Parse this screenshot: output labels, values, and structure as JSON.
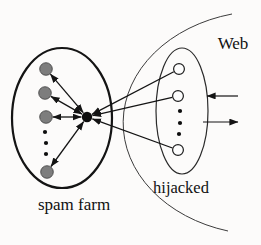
{
  "diagram": {
    "background": "#fcfbfa",
    "line_color": "#141414",
    "labels": {
      "web": "Web",
      "spam_farm": "spam farm",
      "hijacked": "hijacked"
    },
    "label_positions": {
      "web": {
        "x": 233,
        "y": 49,
        "size": 17
      },
      "spam_farm": {
        "x": 74,
        "y": 210,
        "size": 17
      },
      "hijacked": {
        "x": 181,
        "y": 193,
        "size": 16.5
      }
    },
    "regions": {
      "web_boundary": {
        "path": "M 232 14 A 142 112 0 0 0 228 231",
        "stroke": "#3c3c3c",
        "stroke_width": 1
      },
      "spam_farm_ellipse": {
        "cx": 62,
        "cy": 118,
        "rx": 50,
        "ry": 70,
        "stroke": "#141414",
        "stroke_width": 2.2
      },
      "hijacked_ellipse": {
        "cx": 182,
        "cy": 111,
        "rx": 26,
        "ry": 63,
        "stroke": "#2a2a2a",
        "stroke_width": 1.2
      }
    },
    "nodes": {
      "target_page": {
        "id": "t",
        "x": 87,
        "y": 117,
        "r": 5.2,
        "fill": "#0d0d0d",
        "stroke": "none"
      },
      "spam_farm_pages": {
        "r": 6.3,
        "fill": "#7d7d7d",
        "stroke": "#3d3d3d",
        "items": [
          {
            "id": "g1",
            "x": 46,
            "y": 69
          },
          {
            "id": "g2",
            "x": 45,
            "y": 93
          },
          {
            "id": "g3",
            "x": 46,
            "y": 117
          },
          {
            "id": "g4",
            "x": 47,
            "y": 172
          }
        ]
      },
      "hijacked_pages": {
        "r": 5.4,
        "fill": "#fdfdfd",
        "stroke": "#1d1d1d",
        "items": [
          {
            "id": "w1",
            "x": 179,
            "y": 69
          },
          {
            "id": "w2",
            "x": 178,
            "y": 96
          },
          {
            "id": "w3",
            "x": 178,
            "y": 150
          }
        ]
      }
    },
    "ellipsis_dots": {
      "r": 2.1,
      "fill": "#0d0d0d",
      "spam_farm": [
        [
          45,
          132
        ],
        [
          46,
          143
        ],
        [
          46,
          154
        ]
      ],
      "hijacked": [
        [
          180,
          111
        ],
        [
          180,
          123
        ],
        [
          179,
          134
        ]
      ]
    },
    "links": {
      "bidirectional_target_to_farm": [
        [
          "t",
          "g1"
        ],
        [
          "t",
          "g2"
        ],
        [
          "t",
          "g3"
        ],
        [
          "t",
          "g4"
        ]
      ],
      "directed_hijacked_to_target": [
        [
          "w1",
          "t"
        ],
        [
          "w2",
          "t"
        ],
        [
          "w3",
          "t"
        ]
      ]
    },
    "external_arrows": {
      "into_hijacked": {
        "x1": 238,
        "y1": 96,
        "x2": 207,
        "y2": 96
      },
      "out_of_hijacked": {
        "x1": 203,
        "y1": 122,
        "x2": 238,
        "y2": 122
      }
    }
  }
}
